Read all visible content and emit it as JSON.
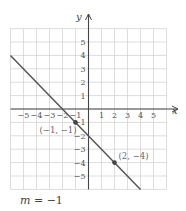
{
  "graph": {
    "x_axis_label": "x",
    "y_axis_label": "y",
    "x_ticks": [
      "-5",
      "-4",
      "-3",
      "-2",
      "-1",
      "1",
      "2",
      "3",
      "4",
      "5"
    ],
    "y_ticks": [
      "5",
      "4",
      "3",
      "2",
      "1",
      "-1",
      "-2",
      "-3",
      "-4",
      "-5"
    ],
    "x_range": [
      -6,
      6
    ],
    "y_range": [
      -6,
      6
    ],
    "points": [
      {
        "x": -1,
        "y": -1,
        "label": "(−1, −1)"
      },
      {
        "x": 2,
        "y": -4,
        "label": "(2, −4)"
      }
    ],
    "line": {
      "from": [
        -6,
        4
      ],
      "to": [
        4,
        -6
      ],
      "equation": "y = -x - 2"
    },
    "colors": {
      "grid": "#cfcfcf",
      "axis": "#444444",
      "line": "#555555",
      "point": "#444444"
    }
  },
  "caption": {
    "variable": "m",
    "equals": " = ",
    "value": "−1"
  }
}
